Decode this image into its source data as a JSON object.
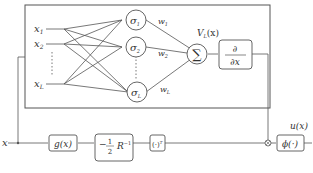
{
  "diagram": {
    "inputs": [
      {
        "label": "x",
        "sub": "1"
      },
      {
        "label": "x",
        "sub": "2"
      },
      {
        "label": "x",
        "sub": "L"
      }
    ],
    "neurons": [
      {
        "label": "σ",
        "sub": "1"
      },
      {
        "label": "σ",
        "sub": "2"
      },
      {
        "label": "σ",
        "sub": "L"
      }
    ],
    "weights": [
      {
        "label": "w",
        "sub": "1"
      },
      {
        "label": "w",
        "sub": "2"
      },
      {
        "label": "w",
        "sub": "L"
      }
    ],
    "sum_symbol": "∑",
    "value_label": "V",
    "value_sub": "L",
    "value_arg": "(x)",
    "derivative_num": "∂",
    "derivative_den": "∂x",
    "input_x": "x",
    "blocks": {
      "g": "g(x)",
      "gain_prefix": "−",
      "gain_num": "1",
      "gain_den": "2",
      "gain_R": "R",
      "gain_exp": "−1",
      "transpose": "(·)",
      "transpose_exp": "T",
      "phi": "ϕ(·)"
    },
    "multiply_symbol": "⊗",
    "output_label": "u(x)",
    "colors": {
      "line": "#555555",
      "text": "#333333"
    }
  }
}
